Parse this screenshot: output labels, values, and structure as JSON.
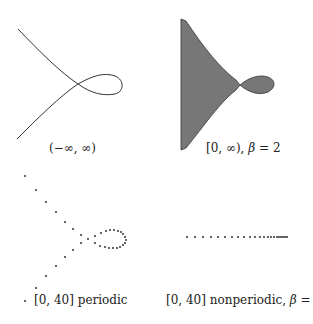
{
  "figure": {
    "panels": [
      {
        "id": "full-curve",
        "caption": "(−∞, ∞)",
        "kind": "curve",
        "description": "Continuous curve with a single self-intersection forming a loop on the right; two branches extend to upper-left and lower-left"
      },
      {
        "id": "halfline-filled",
        "caption_prefix": "[0, ∞), ",
        "caption_beta": "β",
        "caption_suffix": " = 2",
        "kind": "filled-region",
        "fill_color": "#777777",
        "description": "Shaded region bounded on the left by a vertical line, narrowing to a cusp-like crossing and then a filled loop on the right"
      },
      {
        "id": "periodic-samples",
        "caption": "[0, 40] periodic",
        "kind": "dots",
        "description": "Discrete sampled points tracing the curve, sparse along the two branches and dense around the loop"
      },
      {
        "id": "nonperiodic-samples",
        "caption_prefix": "[0, 40] nonperiodic, ",
        "caption_beta": "β",
        "caption_suffix": " = 2",
        "kind": "dots",
        "description": "Discrete points along a horizontal line, spacing decreasing toward the right"
      }
    ],
    "colors": {
      "ink": "#333333",
      "fill": "#777777"
    }
  }
}
